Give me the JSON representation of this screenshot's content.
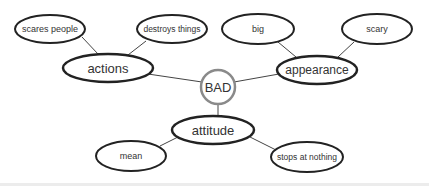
{
  "diagram": {
    "type": "mind-map",
    "center": {
      "id": "bad",
      "label": "BAD",
      "shape": "circle",
      "cx": 218,
      "cy": 87,
      "r": 17,
      "stroke": "#8a8a8a",
      "stroke_width": 2.5,
      "font_size": 13
    },
    "nodes": [
      {
        "id": "actions",
        "label": "actions",
        "cx": 108,
        "cy": 68,
        "rx": 45,
        "ry": 14,
        "stroke_width": 2.5,
        "font_size": 13
      },
      {
        "id": "appearance",
        "label": "appearance",
        "cx": 317,
        "cy": 70,
        "rx": 40,
        "ry": 14,
        "stroke_width": 2.5,
        "font_size": 12
      },
      {
        "id": "attitude",
        "label": "attitude",
        "cx": 213,
        "cy": 130,
        "rx": 41,
        "ry": 14,
        "stroke_width": 2.5,
        "font_size": 13
      },
      {
        "id": "scares-people",
        "label": "scares people",
        "cx": 50,
        "cy": 29,
        "rx": 35,
        "ry": 14,
        "stroke_width": 2,
        "font_size": 9
      },
      {
        "id": "destroys-things",
        "label": "destroys things",
        "cx": 172,
        "cy": 29,
        "rx": 35,
        "ry": 14,
        "stroke_width": 2,
        "font_size": 8.5
      },
      {
        "id": "big",
        "label": "big",
        "cx": 258,
        "cy": 29,
        "rx": 36,
        "ry": 15,
        "stroke_width": 2,
        "font_size": 9
      },
      {
        "id": "scary",
        "label": "scary",
        "cx": 377,
        "cy": 29,
        "rx": 35,
        "ry": 15,
        "stroke_width": 2,
        "font_size": 9
      },
      {
        "id": "mean",
        "label": "mean",
        "cx": 131,
        "cy": 156,
        "rx": 35,
        "ry": 15,
        "stroke_width": 2,
        "font_size": 9
      },
      {
        "id": "stops-at-nothing",
        "label": "stops at nothing",
        "cx": 307,
        "cy": 157,
        "rx": 36,
        "ry": 15,
        "stroke_width": 2,
        "font_size": 8.5
      }
    ],
    "edges": [
      {
        "from": "bad",
        "to": "actions",
        "x1": 202,
        "y1": 82,
        "x2": 148,
        "y2": 74
      },
      {
        "from": "bad",
        "to": "appearance",
        "x1": 234,
        "y1": 82,
        "x2": 279,
        "y2": 74
      },
      {
        "from": "bad",
        "to": "attitude",
        "x1": 218,
        "y1": 104,
        "x2": 218,
        "y2": 116
      },
      {
        "from": "actions",
        "to": "scares-people",
        "x1": 98,
        "y1": 54,
        "x2": 82,
        "y2": 37
      },
      {
        "from": "actions",
        "to": "destroys-things",
        "x1": 128,
        "y1": 55,
        "x2": 146,
        "y2": 41
      },
      {
        "from": "appearance",
        "to": "big",
        "x1": 296,
        "y1": 57,
        "x2": 278,
        "y2": 42
      },
      {
        "from": "appearance",
        "to": "scary",
        "x1": 338,
        "y1": 57,
        "x2": 354,
        "y2": 42
      },
      {
        "from": "attitude",
        "to": "mean",
        "x1": 178,
        "y1": 137,
        "x2": 160,
        "y2": 146
      },
      {
        "from": "attitude",
        "to": "stops-at-nothing",
        "x1": 250,
        "y1": 137,
        "x2": 276,
        "y2": 150
      }
    ],
    "colors": {
      "node_stroke": "#222222",
      "center_stroke": "#8a8a8a",
      "edge": "#444444",
      "text": "#333333",
      "background": "#ffffff"
    }
  }
}
